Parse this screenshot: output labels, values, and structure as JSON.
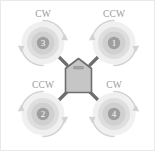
{
  "diagram": {
    "colors": {
      "background": "#ffffff",
      "border": "#e9e9e9",
      "rotor_outer": "#efefef",
      "rotor_ring": "#dcdcdc",
      "rotor_inner": "#cfcfcf",
      "rotor_hub": "#9e9e9e",
      "hub_text": "#ffffff",
      "arrow": "#d2d2d2",
      "arm": "#6e6e6e",
      "body_fill": "#c6c6c6",
      "body_stroke": "#6e6e6e",
      "label_text": "#9a9a9a"
    },
    "body": {
      "slot_label": "body-slot"
    },
    "rotors": [
      {
        "id": "rotor-3",
        "number": "3",
        "direction": "CW",
        "position": "top-left",
        "cx": 42,
        "cy": 42,
        "label_x": 42,
        "label_y": 16
      },
      {
        "id": "rotor-1",
        "number": "1",
        "direction": "CCW",
        "position": "top-right",
        "cx": 113,
        "cy": 42,
        "label_x": 113,
        "label_y": 16
      },
      {
        "id": "rotor-2",
        "number": "2",
        "direction": "CCW",
        "position": "bottom-left",
        "cx": 42,
        "cy": 113,
        "label_x": 42,
        "label_y": 87
      },
      {
        "id": "rotor-4",
        "number": "4",
        "direction": "CW",
        "position": "bottom-right",
        "cx": 113,
        "cy": 113,
        "label_x": 113,
        "label_y": 87
      }
    ],
    "arms": [
      {
        "id": "arm-to-rotor-3",
        "x1": 65,
        "y1": 65,
        "x2": 42,
        "y2": 42
      },
      {
        "id": "arm-to-rotor-1",
        "x1": 90,
        "y1": 65,
        "x2": 113,
        "y2": 42
      },
      {
        "id": "arm-to-rotor-2",
        "x1": 65,
        "y1": 90,
        "x2": 42,
        "y2": 113
      },
      {
        "id": "arm-to-rotor-4",
        "x1": 90,
        "y1": 90,
        "x2": 113,
        "y2": 113
      }
    ]
  }
}
